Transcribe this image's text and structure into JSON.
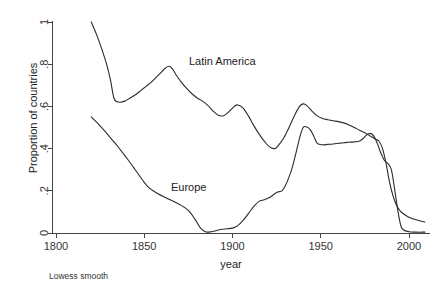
{
  "chart_data": {
    "type": "line",
    "title": "",
    "xlabel": "year",
    "ylabel": "Proportion of countries",
    "note": "Lowess smooth",
    "xlim": [
      1800,
      2010
    ],
    "ylim": [
      0,
      1
    ],
    "grid": false,
    "legend_position": "inline-annotations",
    "xticks": [
      1800,
      1850,
      1900,
      1950,
      2000
    ],
    "xtick_labels": [
      "1800",
      "1850",
      "1900",
      "1950",
      "2000"
    ],
    "yticks": [
      0,
      0.2,
      0.4,
      0.6,
      0.8,
      1
    ],
    "ytick_labels": [
      "0",
      ".2",
      ".4",
      ".6",
      ".8",
      "1"
    ],
    "series": [
      {
        "name": "Latin America",
        "label_x": 1890,
        "label_y": 0.79,
        "x": [
          1820,
          1823,
          1826,
          1829,
          1831,
          1833,
          1836,
          1839,
          1842,
          1845,
          1848,
          1851,
          1854,
          1857,
          1860,
          1862,
          1864,
          1866,
          1868,
          1871,
          1874,
          1877,
          1880,
          1883,
          1886,
          1889,
          1892,
          1895,
          1898,
          1901,
          1903,
          1906,
          1909,
          1912,
          1915,
          1918,
          1921,
          1924,
          1926,
          1929,
          1932,
          1935,
          1938,
          1940,
          1942,
          1945,
          1948,
          1951,
          1954,
          1957,
          1960,
          1963,
          1966,
          1969,
          1972,
          1975,
          1977,
          1979,
          1981,
          1983,
          1985,
          1987,
          1989,
          1991,
          1993,
          1995,
          1997,
          2000,
          2003,
          2006,
          2009
        ],
        "y": [
          1.0,
          0.94,
          0.87,
          0.79,
          0.72,
          0.635,
          0.62,
          0.625,
          0.64,
          0.655,
          0.675,
          0.695,
          0.715,
          0.74,
          0.765,
          0.782,
          0.79,
          0.778,
          0.75,
          0.715,
          0.685,
          0.66,
          0.64,
          0.625,
          0.605,
          0.578,
          0.558,
          0.556,
          0.575,
          0.6,
          0.607,
          0.592,
          0.555,
          0.51,
          0.47,
          0.435,
          0.408,
          0.4,
          0.415,
          0.45,
          0.5,
          0.555,
          0.6,
          0.612,
          0.605,
          0.578,
          0.555,
          0.543,
          0.537,
          0.532,
          0.528,
          0.522,
          0.512,
          0.5,
          0.487,
          0.475,
          0.465,
          0.455,
          0.445,
          0.435,
          0.4,
          0.33,
          0.24,
          0.175,
          0.13,
          0.105,
          0.09,
          0.075,
          0.065,
          0.058,
          0.052
        ]
      },
      {
        "name": "Europe",
        "label_x": 1866,
        "label_y": 0.205,
        "x": [
          1820,
          1823,
          1826,
          1829,
          1832,
          1835,
          1838,
          1841,
          1844,
          1847,
          1850,
          1852,
          1855,
          1858,
          1861,
          1864,
          1867,
          1870,
          1873,
          1876,
          1879,
          1882,
          1885,
          1888,
          1891,
          1894,
          1897,
          1900,
          1903,
          1906,
          1909,
          1912,
          1915,
          1918,
          1921,
          1924,
          1926,
          1928,
          1930,
          1932,
          1934,
          1936,
          1938,
          1940,
          1942,
          1944,
          1946,
          1948,
          1951,
          1954,
          1957,
          1960,
          1963,
          1966,
          1969,
          1972,
          1974,
          1976,
          1978,
          1980,
          1982,
          1984,
          1986,
          1988,
          1990,
          1992,
          1994,
          1996,
          2000,
          2004,
          2009
        ],
        "y": [
          0.55,
          0.525,
          0.498,
          0.47,
          0.44,
          0.41,
          0.378,
          0.345,
          0.31,
          0.275,
          0.24,
          0.22,
          0.2,
          0.185,
          0.172,
          0.16,
          0.148,
          0.135,
          0.12,
          0.098,
          0.062,
          0.022,
          0.005,
          0.006,
          0.012,
          0.018,
          0.02,
          0.023,
          0.035,
          0.06,
          0.092,
          0.125,
          0.15,
          0.158,
          0.168,
          0.186,
          0.195,
          0.2,
          0.225,
          0.265,
          0.315,
          0.38,
          0.45,
          0.5,
          0.502,
          0.49,
          0.46,
          0.425,
          0.418,
          0.42,
          0.422,
          0.425,
          0.428,
          0.43,
          0.432,
          0.436,
          0.448,
          0.465,
          0.472,
          0.46,
          0.425,
          0.38,
          0.345,
          0.33,
          0.3,
          0.2,
          0.09,
          0.022,
          0.006,
          0.004,
          0.004
        ]
      }
    ]
  }
}
